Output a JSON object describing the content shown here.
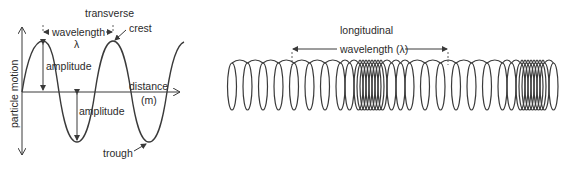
{
  "transverse": {
    "title": "transverse",
    "wavelength_label": "wavelength",
    "lambda_symbol": "λ",
    "crest_label": "crest",
    "trough_label": "trough",
    "amplitude_label_upper": "amplitude",
    "amplitude_label_lower": "amplitude",
    "x_axis_label": "distance",
    "x_axis_unit": "(m)",
    "y_axis_label": "particle motion"
  },
  "longitudinal": {
    "title": "longitudinal",
    "wavelength_label": "wavelength (λ)"
  },
  "colors": {
    "line": "#3a3a3a",
    "text": "#2b2b2b",
    "background": "#ffffff"
  }
}
